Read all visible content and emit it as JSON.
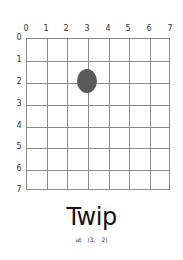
{
  "board": {
    "columns": [
      "0",
      "1",
      "2",
      "3",
      "4",
      "5",
      "6",
      "7"
    ],
    "rows": [
      "0",
      "1",
      "2",
      "3",
      "4",
      "5",
      "6",
      "7"
    ],
    "grid_color": "#8a8a8a",
    "piece": {
      "name": "Twip",
      "x": 3,
      "y": 2,
      "color": "#5a5a5a"
    }
  },
  "title": "Twip",
  "caption": {
    "prefix": "at",
    "x": "(3,",
    "y": "2)"
  }
}
